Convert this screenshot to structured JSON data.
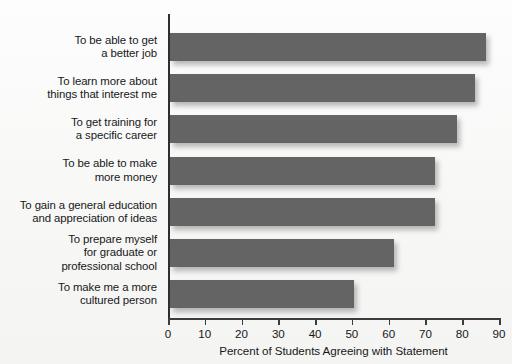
{
  "chart": {
    "type": "bar",
    "orientation": "horizontal",
    "bar_color": "#646464",
    "background_color": "#f7f7f6",
    "axis_color": "#2c2f31",
    "text_color": "#16181a"
  },
  "chart_data": {
    "type": "bar",
    "title": "",
    "xlabel": "Percent of Students Agreeing with Statement",
    "ylabel": "",
    "xlim": [
      0,
      90
    ],
    "grid": false,
    "legend": "none",
    "orientation": "horizontal",
    "tick_labels": [
      "0",
      "10",
      "20",
      "30",
      "40",
      "50",
      "60",
      "70",
      "80",
      "90"
    ],
    "ticks": [
      0,
      10,
      20,
      30,
      40,
      50,
      60,
      70,
      80,
      90
    ],
    "categories": [
      "To be able to get\na better job",
      "To learn more about\nthings that interest me",
      "To get training for\na specific career",
      "To be able to make\nmore money",
      "To gain a general education\nand appreciation of ideas",
      "To prepare myself\nfor graduate or\nprofessional school",
      "To make me a more\ncultured person"
    ],
    "values": [
      86,
      83,
      78,
      72,
      72,
      61,
      50
    ]
  }
}
